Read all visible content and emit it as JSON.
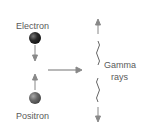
{
  "diagram": {
    "particles": [
      {
        "label": "Electron",
        "color": "#222222"
      },
      {
        "label": "Positron",
        "color": "#6e6e6e"
      }
    ],
    "products": {
      "label_line1": "Gamma",
      "label_line2": "rays"
    },
    "colors": {
      "arrow": "#888888",
      "text": "#5a5a5a"
    }
  }
}
